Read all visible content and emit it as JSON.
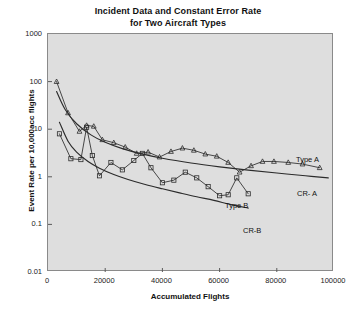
{
  "chart_data": {
    "type": "line",
    "title": "Incident Data and Constant Error Rate for Two Aircraft Types",
    "title_line1": "Incident Data and Constant Error Rate",
    "title_line2": "for Two Aircraft Types",
    "xlabel": "Accumulated Flights",
    "ylabel": "Event Rate per 10,000acc flights",
    "xlim": [
      0,
      100000
    ],
    "ylim": [
      0.01,
      1000
    ],
    "yscale": "log",
    "xscale": "linear",
    "grid": false,
    "legend_position": "inline-annotations",
    "plot_background": "#dedede",
    "line_color": "#2b2b2b",
    "xticks": [
      0,
      20000,
      40000,
      60000,
      80000,
      100000
    ],
    "xtick_labels": [
      "0",
      "20000",
      "40000",
      "60000",
      "80000",
      "100000"
    ],
    "yticks": [
      0.01,
      0.1,
      1,
      10,
      100,
      1000
    ],
    "ytick_labels": [
      "0.01",
      "0.1",
      "1",
      "10",
      "100",
      "1000"
    ],
    "series": [
      {
        "name": "Type A",
        "marker": "triangle",
        "smooth": false,
        "annotation": "Type A",
        "points": [
          [
            3000,
            100
          ],
          [
            7000,
            22
          ],
          [
            11000,
            9.0
          ],
          [
            13500,
            12.0
          ],
          [
            16000,
            11.5
          ],
          [
            19000,
            6.0
          ],
          [
            23000,
            5.2
          ],
          [
            27000,
            4.2
          ],
          [
            31000,
            3.1
          ],
          [
            35000,
            3.3
          ],
          [
            39000,
            2.6
          ],
          [
            43000,
            3.4
          ],
          [
            47000,
            4.0
          ],
          [
            51000,
            3.6
          ],
          [
            55000,
            3.0
          ],
          [
            59000,
            2.7
          ],
          [
            63000,
            2.0
          ],
          [
            67000,
            1.25
          ],
          [
            71000,
            1.7
          ],
          [
            75000,
            2.1
          ],
          [
            79000,
            2.1
          ],
          [
            84000,
            2.0
          ],
          [
            89000,
            1.85
          ],
          [
            95000,
            1.55
          ]
        ]
      },
      {
        "name": "Type B",
        "marker": "square",
        "smooth": false,
        "annotation": "Type B",
        "points": [
          [
            4000,
            8.0
          ],
          [
            8000,
            2.4
          ],
          [
            11500,
            2.3
          ],
          [
            13500,
            11.0
          ],
          [
            15500,
            2.8
          ],
          [
            18000,
            1.05
          ],
          [
            22000,
            2.0
          ],
          [
            26000,
            1.4
          ],
          [
            30000,
            2.2
          ],
          [
            33000,
            3.1
          ],
          [
            36000,
            1.55
          ],
          [
            40000,
            0.75
          ],
          [
            44000,
            0.85
          ],
          [
            48000,
            1.25
          ],
          [
            52000,
            0.95
          ],
          [
            56000,
            0.62
          ],
          [
            60000,
            0.4
          ],
          [
            63000,
            0.42
          ],
          [
            66000,
            0.95
          ],
          [
            70000,
            0.44
          ]
        ]
      },
      {
        "name": "CR- A",
        "marker": "none",
        "smooth": true,
        "annotation": "CR- A",
        "points": [
          [
            3000,
            62
          ],
          [
            6000,
            26
          ],
          [
            10000,
            13.0
          ],
          [
            15000,
            7.6
          ],
          [
            20000,
            5.3
          ],
          [
            26000,
            3.9
          ],
          [
            32000,
            3.1
          ],
          [
            40000,
            2.45
          ],
          [
            50000,
            1.95
          ],
          [
            60000,
            1.62
          ],
          [
            70000,
            1.38
          ],
          [
            80000,
            1.2
          ],
          [
            90000,
            1.05
          ],
          [
            98000,
            0.95
          ]
        ]
      },
      {
        "name": "CR-B",
        "marker": "none",
        "smooth": true,
        "annotation": "CR-B",
        "points": [
          [
            4000,
            14.0
          ],
          [
            7000,
            5.6
          ],
          [
            10000,
            3.3
          ],
          [
            14000,
            2.1
          ],
          [
            18000,
            1.52
          ],
          [
            23000,
            1.12
          ],
          [
            28000,
            0.88
          ],
          [
            34000,
            0.69
          ],
          [
            40000,
            0.56
          ],
          [
            46000,
            0.46
          ],
          [
            52000,
            0.38
          ],
          [
            58000,
            0.32
          ],
          [
            64000,
            0.26
          ],
          [
            70000,
            0.22
          ]
        ]
      }
    ]
  }
}
